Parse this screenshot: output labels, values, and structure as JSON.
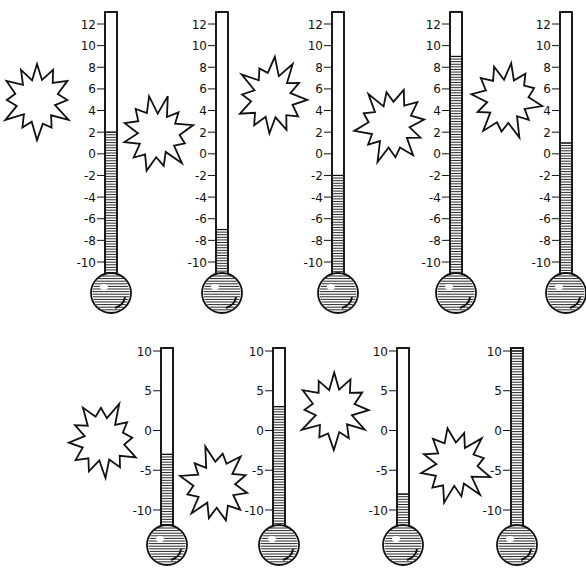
{
  "worksheet": {
    "rows": [
      {
        "name": "top-row",
        "scale": {
          "min": -10,
          "max": 12,
          "step": 2,
          "labels": [
            "12",
            "10",
            "8",
            "6",
            "4",
            "2",
            "0",
            "-2",
            "-4",
            "-6",
            "-8",
            "-10"
          ]
        },
        "thermometers": [
          {
            "id": 1,
            "reading": 2
          },
          {
            "id": 2,
            "reading": -7
          },
          {
            "id": 3,
            "reading": -2
          },
          {
            "id": 4,
            "reading": 9
          },
          {
            "id": 5,
            "reading": 1
          }
        ]
      },
      {
        "name": "bottom-row",
        "scale": {
          "min": -10,
          "max": 10,
          "step": 5,
          "labels": [
            "10",
            "5",
            "0",
            "-5",
            "-10"
          ]
        },
        "thermometers": [
          {
            "id": 6,
            "reading": -3
          },
          {
            "id": 7,
            "reading": 3
          },
          {
            "id": 8,
            "reading": -8
          },
          {
            "id": 9,
            "reading": 10
          }
        ]
      }
    ],
    "answer_bursts": 9,
    "colors": {
      "ink": "#111111",
      "paper": "#ffffff"
    }
  }
}
